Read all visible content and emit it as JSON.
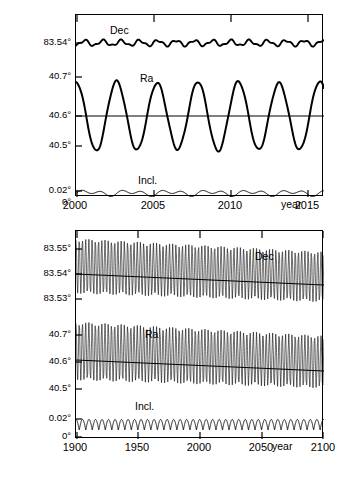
{
  "chart_data": [
    {
      "type": "line",
      "title": "",
      "subtitle": "",
      "xlabel": "year",
      "ylabel": "",
      "xlim": [
        2000,
        2016
      ],
      "xticks": [
        2000,
        2005,
        2010,
        2015
      ],
      "xticklabels": [
        "2000",
        "2005",
        "2010",
        "2015"
      ],
      "grid": false,
      "legend": "inline-annotations",
      "yticklabels": [
        "83.54°",
        "40.7°",
        "40.6°",
        "40.5°",
        "0.02°",
        "0°"
      ],
      "annotations": [
        "Dec",
        "Ra",
        "Incl."
      ],
      "series": [
        {
          "name": "Dec",
          "unit": "degrees",
          "axis_label": "83.54°",
          "description": "Declination, small oscillation about 83.54 deg with ~1.2 yr ripple",
          "mean": 83.5405,
          "amplitude": 0.0035,
          "x": [
            2000.0,
            2000.4,
            2000.8,
            2001.2,
            2001.6,
            2002.0,
            2002.4,
            2002.8,
            2003.2,
            2003.6,
            2004.0,
            2004.4,
            2004.8,
            2005.2,
            2005.6,
            2006.0,
            2006.4,
            2006.8,
            2007.2,
            2007.6,
            2008.0,
            2008.4,
            2008.8,
            2009.2,
            2009.6,
            2010.0,
            2010.4,
            2010.8,
            2011.2,
            2011.6,
            2012.0,
            2012.4,
            2012.8,
            2013.2,
            2013.6,
            2014.0,
            2014.4,
            2014.8,
            2015.2,
            2015.6,
            2016.0
          ],
          "y": [
            83.5375,
            83.543,
            83.5442,
            83.5408,
            83.5392,
            83.5418,
            83.544,
            83.542,
            83.5396,
            83.5412,
            83.5438,
            83.5428,
            83.54,
            83.5406,
            83.5434,
            83.5432,
            83.5404,
            83.54,
            83.5428,
            83.5436,
            83.5408,
            83.5398,
            83.5422,
            83.5438,
            83.5414,
            83.5396,
            83.5416,
            83.5438,
            83.542,
            83.5396,
            83.5408,
            83.5434,
            83.5428,
            83.54,
            83.5402,
            83.543,
            83.5434,
            83.5406,
            83.5398,
            83.5424,
            83.544
          ]
        },
        {
          "name": "Ra",
          "unit": "degrees",
          "description": "Right ascension, large ~2.6 yr oscillation between 40.5 and 40.7 deg",
          "mean": 40.592,
          "amplitude": 0.085,
          "period_years": 2.6,
          "x": [
            2000.0,
            2000.65,
            2001.3,
            2001.95,
            2002.6,
            2003.25,
            2003.9,
            2004.55,
            2005.2,
            2005.85,
            2006.5,
            2007.15,
            2007.8,
            2008.45,
            2009.1,
            2009.75,
            2010.4,
            2011.05,
            2011.7,
            2012.35,
            2013.0,
            2013.65,
            2014.3,
            2014.95,
            2015.6,
            2016.0
          ],
          "y": [
            40.7,
            40.6,
            40.505,
            40.598,
            40.69,
            40.6,
            40.498,
            40.6,
            40.688,
            40.596,
            40.496,
            40.594,
            40.686,
            40.592,
            40.494,
            40.592,
            40.684,
            40.59,
            40.492,
            40.59,
            40.682,
            40.588,
            40.49,
            40.588,
            40.68,
            40.7
          ]
        },
        {
          "name": "Incl.",
          "unit": "degrees",
          "description": "Inclination, low-amplitude wave just above 0 deg",
          "mean": 0.006,
          "amplitude": 0.004,
          "x": [
            2000.0,
            2001.0,
            2002.0,
            2003.0,
            2004.0,
            2005.0,
            2006.0,
            2007.0,
            2008.0,
            2009.0,
            2010.0,
            2011.0,
            2012.0,
            2013.0,
            2014.0,
            2015.0,
            2016.0
          ],
          "y": [
            0.004,
            0.007,
            0.005,
            0.008,
            0.005,
            0.009,
            0.006,
            0.009,
            0.006,
            0.01,
            0.006,
            0.009,
            0.005,
            0.008,
            0.005,
            0.008,
            0.006
          ]
        }
      ]
    },
    {
      "type": "line",
      "title": "",
      "xlabel": "year",
      "ylabel": "",
      "xlim": [
        1900,
        2100
      ],
      "xticks": [
        1900,
        1950,
        2000,
        2050,
        2100
      ],
      "xticklabels": [
        "1900",
        "1950",
        "2000",
        "2050",
        "2100"
      ],
      "grid": false,
      "legend": "inline-annotations",
      "yticklabels": [
        "83.55°",
        "83.54°",
        "83.53°",
        "40.7°",
        "40.6°",
        "40.5°",
        "0.02°",
        "0°"
      ],
      "annotations": [
        "Dec",
        "Ra",
        "Incl."
      ],
      "series": [
        {
          "name": "Dec",
          "unit": "degrees",
          "description": "Dense oscillation envelope around 83.54 deg, slowly declining trend line",
          "envelope_start": [
            83.5325,
            83.5475
          ],
          "envelope_end": [
            83.5295,
            83.5445
          ],
          "trend_start": 83.5412,
          "trend_end": 83.5368,
          "oscillation_count": 77
        },
        {
          "name": "Ra",
          "unit": "degrees",
          "description": "Dense oscillation envelope around 40.6 deg, slowly declining trend line",
          "envelope_start": [
            40.505,
            40.7
          ],
          "envelope_end": [
            40.5,
            40.675
          ],
          "trend_start": 40.618,
          "trend_end": 40.572,
          "oscillation_count": 77
        },
        {
          "name": "Incl.",
          "unit": "degrees",
          "description": "Regular oscillation between 0 and about 0.013 deg",
          "envelope_start": [
            0.0,
            0.013
          ],
          "envelope_end": [
            0.0,
            0.013
          ],
          "oscillation_count": 38
        }
      ]
    }
  ],
  "top": {
    "yticks": [
      {
        "label": "83.54°",
        "y": 28
      },
      {
        "label": "40.7°",
        "y": 62
      },
      {
        "label": "40.6°",
        "y": 101
      },
      {
        "label": "40.5°",
        "y": 131
      },
      {
        "label": "0.02°",
        "y": 176
      },
      {
        "label": "0°",
        "y": 188
      }
    ],
    "xticks": [
      {
        "label": "2000",
        "x": 0
      },
      {
        "label": "2005",
        "x": 78
      },
      {
        "label": "2010",
        "x": 155
      },
      {
        "label": "2015",
        "x": 232
      }
    ],
    "axis_word": "year",
    "labels": {
      "dec": "Dec",
      "ra": "Ra",
      "incl": "Incl."
    }
  },
  "bottom": {
    "yticks": [
      {
        "label": "83.55°",
        "y": 18
      },
      {
        "label": "83.54°",
        "y": 43
      },
      {
        "label": "83.53°",
        "y": 68
      },
      {
        "label": "40.7°",
        "y": 104
      },
      {
        "label": "40.6°",
        "y": 131
      },
      {
        "label": "40.5°",
        "y": 158
      },
      {
        "label": "0.02°",
        "y": 188
      },
      {
        "label": "0°",
        "y": 206
      }
    ],
    "xticks": [
      {
        "label": "1900",
        "x": 0
      },
      {
        "label": "1950",
        "x": 62
      },
      {
        "label": "2000",
        "x": 124
      },
      {
        "label": "2050",
        "x": 186
      },
      {
        "label": "2100",
        "x": 248
      }
    ],
    "axis_word": "year",
    "labels": {
      "dec": "Dec",
      "ra": "Ra",
      "incl": "Incl."
    }
  }
}
